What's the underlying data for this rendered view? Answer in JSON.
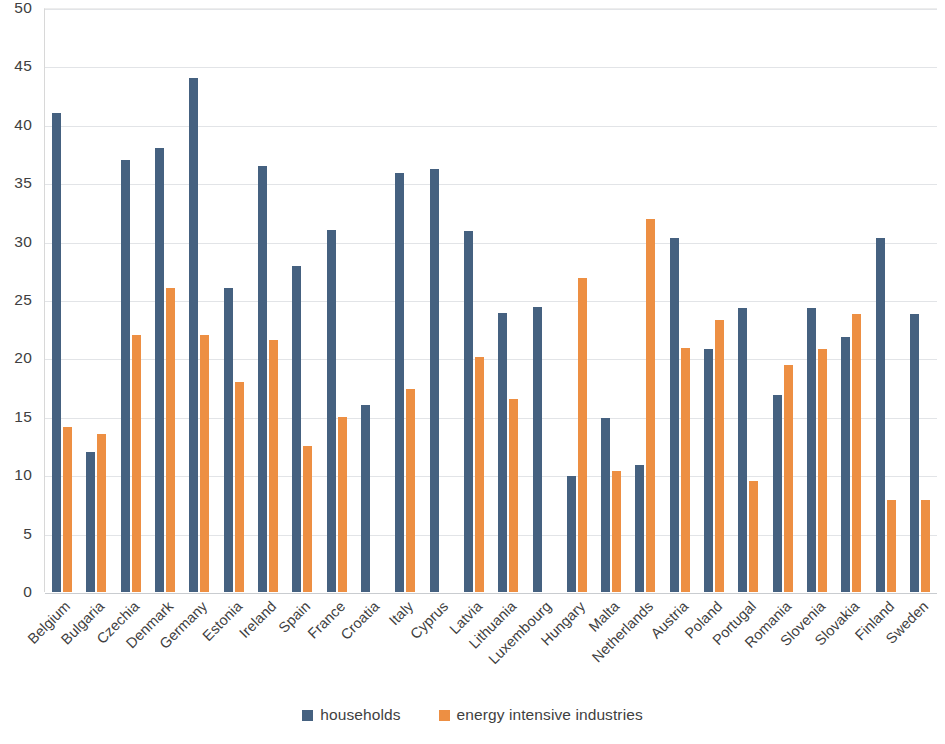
{
  "chart_data": {
    "type": "bar",
    "title": "",
    "subtitle": "",
    "xlabel": "",
    "ylabel": "",
    "ylim": [
      0,
      50
    ],
    "y_ticks": [
      0,
      5,
      10,
      15,
      20,
      25,
      30,
      35,
      40,
      45,
      50
    ],
    "grid": true,
    "legend_position": "bottom",
    "categories": [
      "Belgium",
      "Bulgaria",
      "Czechia",
      "Denmark",
      "Germany",
      "Estonia",
      "Ireland",
      "Spain",
      "France",
      "Croatia",
      "Italy",
      "Cyprus",
      "Latvia",
      "Lithuania",
      "Luxembourg",
      "Hungary",
      "Malta",
      "Netherlands",
      "Austria",
      "Poland",
      "Portugal",
      "Romania",
      "Slovenia",
      "Slovakia",
      "Finland",
      "Sweden"
    ],
    "series": [
      {
        "name": "households",
        "color": "#456180",
        "values": [
          41.0,
          12.0,
          37.0,
          38.0,
          44.0,
          26.0,
          36.5,
          27.9,
          31.0,
          16.0,
          35.9,
          36.2,
          30.9,
          23.9,
          24.4,
          9.9,
          14.9,
          10.9,
          30.3,
          20.8,
          24.3,
          16.9,
          24.3,
          21.8,
          30.3,
          23.8
        ]
      },
      {
        "name": "energy intensive industries",
        "color": "#ed8f43",
        "values": [
          14.1,
          13.5,
          22.0,
          26.0,
          22.0,
          18.0,
          21.6,
          12.5,
          15.0,
          null,
          17.4,
          null,
          20.1,
          16.5,
          null,
          26.9,
          10.4,
          31.9,
          20.9,
          23.3,
          9.5,
          19.4,
          20.8,
          23.8,
          7.9,
          7.9
        ]
      }
    ]
  },
  "legend": {
    "items": [
      {
        "label": "households",
        "swatch": "households"
      },
      {
        "label": "energy intensive industries",
        "swatch": "industries"
      }
    ]
  }
}
